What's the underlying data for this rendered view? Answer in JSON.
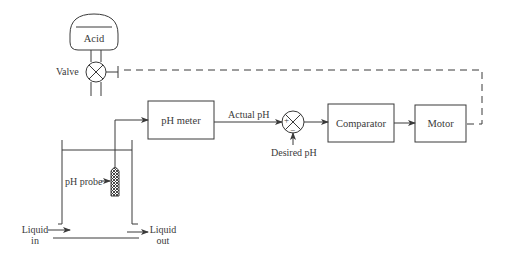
{
  "diagram": {
    "acid_tank": {
      "label": "Acid"
    },
    "valve": {
      "label": "Valve"
    },
    "blocks": [
      {
        "id": "ph_meter",
        "label": "pH meter"
      },
      {
        "id": "comparator",
        "label": "Comparator"
      },
      {
        "id": "motor",
        "label": "Motor"
      }
    ],
    "signals": {
      "actual_ph": "Actual pH",
      "desired_ph": "Desired pH"
    },
    "summing_junction": {
      "plus": "+",
      "minus": "−"
    },
    "vessel": {
      "probe_label": "pH probe",
      "inlet_label_line1": "Liquid",
      "inlet_label_line2": "in",
      "outlet_label_line1": "Liquid",
      "outlet_label_line2": "out"
    },
    "colors": {
      "line": "#3a3a3a",
      "background": "#ffffff"
    }
  }
}
